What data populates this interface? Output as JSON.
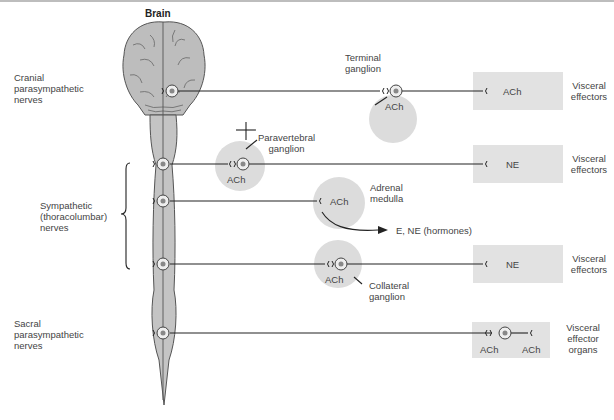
{
  "title": "Brain",
  "left_labels": {
    "cranial": [
      "Cranial",
      "parasympathetic",
      "nerves"
    ],
    "sympathetic": [
      "Sympathetic",
      "(thoracolumbar)",
      "nerves"
    ],
    "sacral": [
      "Sacral",
      "parasympathetic",
      "nerves"
    ]
  },
  "ganglia": {
    "terminal": [
      "Terminal",
      "ganglion"
    ],
    "paravertebral": [
      "Paravertebral",
      "ganglion"
    ],
    "adrenal": [
      "Adrenal",
      "medulla"
    ],
    "collateral": [
      "Collateral",
      "ganglion"
    ]
  },
  "neurotransmitters": {
    "terminal": "ACh",
    "paravertebral": "ACh",
    "adrenal": "ACh",
    "collateral": "ACh",
    "effector_1": "ACh",
    "effector_2": "NE",
    "effector_4": "NE",
    "effector_5_left": "ACh",
    "effector_5_right": "ACh"
  },
  "hormones": "E, NE (hormones)",
  "effectors": {
    "row1": [
      "Visceral",
      "effectors"
    ],
    "row2": [
      "Visceral",
      "effectors"
    ],
    "row4": [
      "Visceral",
      "effectors"
    ],
    "row5": [
      "Visceral",
      "effector",
      "organs"
    ]
  },
  "colors": {
    "cord_fill": "#c4c4c4",
    "cord_stroke": "#555555",
    "ganglion_fill": "#dcdcdc",
    "effector_fill": "#e2e2e2",
    "line": "#222222"
  }
}
